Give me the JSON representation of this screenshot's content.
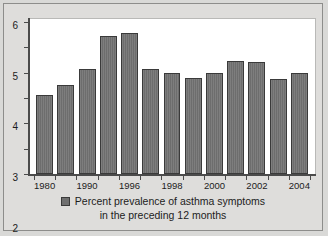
{
  "chart_data": {
    "type": "bar",
    "title": "",
    "subtitle": "",
    "xlabel": "",
    "ylabel": "",
    "ylim": [
      0,
      6
    ],
    "ytick_labels": [
      "0",
      "1",
      "2",
      "3",
      "4",
      "5",
      "6"
    ],
    "yticks": [
      0,
      1,
      2,
      3,
      4,
      5,
      6
    ],
    "grid": false,
    "legend_position": "bottom-center",
    "legend": [
      {
        "label_line1": "Percent prevalence of asthma symptoms",
        "label_line2": "in the preceding 12 months",
        "color": "#6f6f6f"
      }
    ],
    "xtick_labels": [
      "1980",
      "1990",
      "1996",
      "1998",
      "2000",
      "2002",
      "2004"
    ],
    "xtick_bar_index": [
      0,
      2,
      4,
      6,
      8,
      10,
      12
    ],
    "categories": [
      "1980",
      "",
      "1990",
      "",
      "1996",
      "",
      "1998",
      "",
      "2000",
      "",
      "2002",
      "",
      "2004"
    ],
    "values": [
      3.1,
      3.5,
      4.15,
      5.45,
      5.55,
      4.15,
      3.98,
      3.78,
      3.98,
      4.45,
      4.42,
      3.75,
      4.0
    ],
    "bar_color": "#6f6f6f",
    "bar_edge_color": "#3a3a3a",
    "plot_background": "#ffffff",
    "figure_background": "#dedddb",
    "axis_color": "#4b4b4b",
    "text_color": "#1c1c1c"
  }
}
